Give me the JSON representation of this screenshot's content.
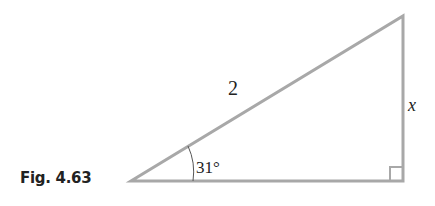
{
  "figure": {
    "label": "Fig. 4.63",
    "hypotenuse_label": "2",
    "opposite_label": "x",
    "angle_label": "31°",
    "line_color": "#a8a8a8",
    "right_angle_marker": true
  }
}
